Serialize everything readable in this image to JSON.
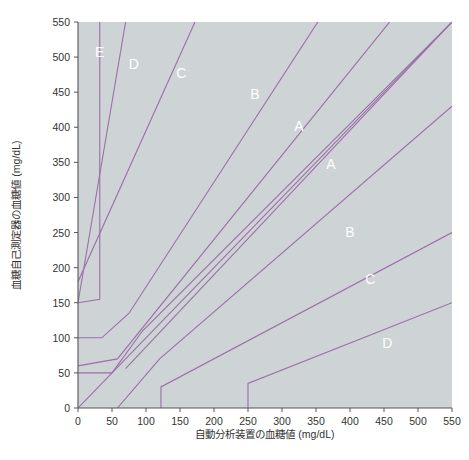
{
  "figure": {
    "background_color": "#ffffff",
    "plot_background_color": "#ced3d6",
    "line_color": "#9b6fa8",
    "axis_color": "#555555",
    "zone_label_color": "#ffffff"
  },
  "chart_data": {
    "type": "line",
    "title": "",
    "subtitle": "",
    "xlabel": "自動分析装置の血糖値 (mg/dL)",
    "ylabel": "血糖自己測定器の血糖値 (mg/dL)",
    "xlim": [
      0,
      550
    ],
    "ylim": [
      0,
      550
    ],
    "grid": false,
    "legend_position": "none",
    "xticks": [
      0,
      50,
      100,
      150,
      200,
      250,
      300,
      350,
      400,
      450,
      500,
      550
    ],
    "yticks": [
      0,
      50,
      100,
      150,
      200,
      250,
      300,
      350,
      400,
      450,
      500,
      550
    ],
    "xtick_labels": [
      "0",
      "50",
      "100",
      "150",
      "200",
      "250",
      "300",
      "350",
      "400",
      "450",
      "500",
      "550"
    ],
    "ytick_labels": [
      "0",
      "50",
      "100",
      "150",
      "200",
      "250",
      "300",
      "350",
      "400",
      "450",
      "500",
      "550"
    ],
    "annotations": [
      {
        "text": "E",
        "x": 32,
        "y": 500
      },
      {
        "text": "D",
        "x": 82,
        "y": 483
      },
      {
        "text": "C",
        "x": 152,
        "y": 470
      },
      {
        "text": "B",
        "x": 260,
        "y": 440
      },
      {
        "text": "A",
        "x": 325,
        "y": 395
      },
      {
        "text": "A",
        "x": 372,
        "y": 340
      },
      {
        "text": "B",
        "x": 400,
        "y": 243
      },
      {
        "text": "C",
        "x": 430,
        "y": 177
      },
      {
        "text": "D",
        "x": 455,
        "y": 85
      }
    ],
    "series": [
      {
        "name": "identity-diagonal",
        "points": [
          [
            0,
            0
          ],
          [
            550,
            550
          ]
        ]
      },
      {
        "name": "zoneA-upper-boundary",
        "points": [
          [
            0,
            60
          ],
          [
            58,
            70
          ],
          [
            550,
            660
          ]
        ]
      },
      {
        "name": "zoneA-lower-boundary",
        "points": [
          [
            58,
            0
          ],
          [
            120,
            70
          ],
          [
            550,
            430
          ]
        ]
      },
      {
        "name": "zoneB-upper-boundary",
        "points": [
          [
            0,
            100
          ],
          [
            35,
            100
          ],
          [
            75,
            135
          ],
          [
            550,
            845
          ]
        ]
      },
      {
        "name": "zoneB-lower-boundary",
        "points": [
          [
            122,
            0
          ],
          [
            122,
            30
          ],
          [
            550,
            250
          ]
        ]
      },
      {
        "name": "zoneC-upper-boundary",
        "points": [
          [
            0,
            150
          ],
          [
            32,
            155
          ],
          [
            32,
            550
          ]
        ]
      },
      {
        "name": "zoneC-lower-boundary",
        "points": [
          [
            250,
            0
          ],
          [
            250,
            35
          ],
          [
            550,
            150
          ]
        ]
      },
      {
        "name": "zoneD-upper-boundary",
        "points": [
          [
            0,
            150
          ],
          [
            70,
            550
          ]
        ]
      },
      {
        "name": "zoneE-boundary",
        "points": [
          [
            0,
            180
          ],
          [
            172,
            550
          ]
        ]
      },
      {
        "name": "zoneB-right-upper",
        "points": [
          [
            70,
            56
          ],
          [
            550,
            550
          ]
        ]
      },
      {
        "name": "zoneA-15pct-upper",
        "points": [
          [
            0,
            50
          ],
          [
            50,
            50
          ],
          [
            95,
            110
          ],
          [
            550,
            550
          ]
        ]
      }
    ]
  },
  "caption": {
    "text": ""
  }
}
